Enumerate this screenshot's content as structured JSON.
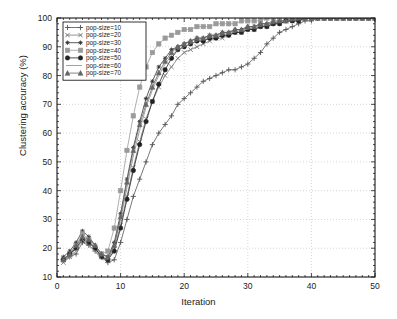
{
  "chart_data": {
    "type": "line",
    "title": "",
    "xlabel": "Iteration",
    "ylabel": "Clustering accuracy (%)",
    "xlim": [
      0,
      50
    ],
    "ylim": [
      10,
      100
    ],
    "xticks": [
      0,
      10,
      20,
      30,
      40,
      50
    ],
    "yticks": [
      10,
      20,
      30,
      40,
      50,
      60,
      70,
      80,
      90,
      100
    ],
    "grid": true,
    "legend_position": "top-left",
    "x": [
      1,
      2,
      3,
      4,
      5,
      6,
      7,
      8,
      9,
      10,
      11,
      12,
      13,
      14,
      15,
      16,
      17,
      18,
      19,
      20,
      21,
      22,
      23,
      24,
      25,
      26,
      27,
      28,
      29,
      30,
      31,
      32,
      33,
      34,
      35,
      36,
      37,
      38,
      39,
      40,
      41,
      42,
      43,
      44,
      45,
      46,
      47,
      48,
      49,
      50
    ],
    "series": [
      {
        "name": "pop-size=10",
        "marker": "plus",
        "color": "#555555",
        "values": [
          16,
          17,
          18,
          22,
          21,
          19,
          17,
          15,
          16,
          22,
          30,
          38,
          44,
          50,
          56,
          60,
          63,
          66,
          70,
          72,
          74,
          76,
          78,
          79,
          80,
          81,
          82,
          82,
          83,
          84,
          86,
          88,
          91,
          93,
          95,
          96,
          97,
          98,
          99,
          99,
          100,
          100,
          100,
          100,
          100,
          100,
          100,
          100,
          100,
          100
        ]
      },
      {
        "name": "pop-size=20",
        "marker": "x",
        "color": "#777777",
        "values": [
          15,
          17,
          20,
          24,
          22,
          20,
          17,
          16,
          20,
          28,
          38,
          48,
          57,
          65,
          71,
          76,
          80,
          83,
          86,
          88,
          89,
          90,
          91,
          92,
          93,
          93,
          94,
          95,
          95,
          96,
          96,
          97,
          97,
          98,
          98,
          99,
          99,
          99,
          100,
          100,
          100,
          100,
          100,
          100,
          100,
          100,
          100,
          100,
          100,
          100
        ]
      },
      {
        "name": "pop-size=30",
        "marker": "star",
        "color": "#333333",
        "values": [
          17,
          19,
          22,
          26,
          24,
          21,
          18,
          17,
          22,
          32,
          44,
          55,
          64,
          72,
          78,
          83,
          86,
          89,
          90,
          91,
          92,
          93,
          93,
          94,
          94,
          95,
          95,
          96,
          96,
          97,
          97,
          98,
          98,
          98,
          99,
          99,
          99,
          100,
          100,
          100,
          100,
          100,
          100,
          100,
          100,
          100,
          100,
          100,
          100,
          100
        ]
      },
      {
        "name": "pop-size=40",
        "marker": "square",
        "color": "#9a9a9a",
        "values": [
          16,
          18,
          21,
          25,
          23,
          20,
          18,
          19,
          27,
          40,
          54,
          66,
          76,
          83,
          88,
          91,
          93,
          94,
          95,
          96,
          96,
          97,
          97,
          97,
          98,
          98,
          98,
          98,
          99,
          99,
          99,
          99,
          100,
          100,
          100,
          100,
          100,
          100,
          100,
          100,
          100,
          100,
          100,
          100,
          100,
          100,
          100,
          100,
          100,
          100
        ]
      },
      {
        "name": "pop-size=50",
        "marker": "circle",
        "color": "#222222",
        "values": [
          16,
          18,
          20,
          23,
          22,
          20,
          17,
          16,
          19,
          27,
          37,
          47,
          56,
          64,
          71,
          77,
          82,
          86,
          89,
          90,
          91,
          92,
          92,
          93,
          93,
          94,
          94,
          95,
          95,
          96,
          96,
          97,
          97,
          98,
          98,
          99,
          99,
          99,
          100,
          100,
          100,
          100,
          100,
          100,
          100,
          100,
          100,
          100,
          100,
          100
        ]
      },
      {
        "name": "pop-size=60",
        "marker": "none",
        "color": "#8c8c8c",
        "values": [
          15,
          17,
          19,
          23,
          21,
          19,
          16,
          16,
          21,
          30,
          41,
          52,
          61,
          69,
          75,
          80,
          84,
          87,
          89,
          90,
          91,
          92,
          93,
          93,
          94,
          94,
          95,
          95,
          96,
          96,
          97,
          97,
          98,
          98,
          99,
          99,
          99,
          100,
          100,
          100,
          100,
          100,
          100,
          100,
          100,
          100,
          100,
          100,
          100,
          100
        ]
      },
      {
        "name": "pop-size=70",
        "marker": "triangle",
        "color": "#666666",
        "values": [
          16,
          18,
          21,
          24,
          23,
          21,
          18,
          17,
          21,
          31,
          43,
          54,
          63,
          70,
          76,
          81,
          85,
          88,
          90,
          91,
          92,
          93,
          93,
          94,
          94,
          95,
          95,
          96,
          96,
          97,
          97,
          98,
          98,
          99,
          99,
          99,
          100,
          100,
          100,
          100,
          100,
          100,
          100,
          100,
          100,
          100,
          100,
          100,
          100,
          100
        ]
      }
    ]
  }
}
